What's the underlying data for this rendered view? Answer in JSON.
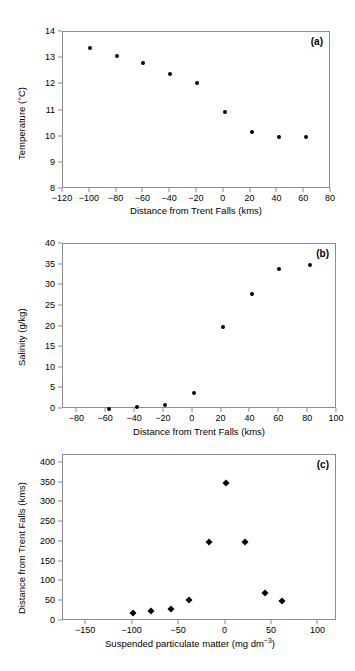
{
  "figure": {
    "background_color": "#ffffff",
    "marker_color": "#000000",
    "axis_color": "#8c8c8c"
  },
  "chart_data": [
    {
      "type": "scatter",
      "panel_label": "(a)",
      "title": "",
      "xlabel": "Distance from Trent Falls (kms)",
      "ylabel": "Temperature (°C)",
      "xlim": [
        -120,
        80
      ],
      "ylim": [
        8,
        14
      ],
      "xticks": [
        -120,
        -100,
        -80,
        -60,
        -40,
        -20,
        0,
        20,
        40,
        60,
        80
      ],
      "xticklabels": [
        "−120",
        "−100",
        "−80",
        "−60",
        "−40",
        "−20",
        "0",
        "20",
        "40",
        "60",
        "80"
      ],
      "yticks": [
        8,
        9,
        10,
        11,
        12,
        13,
        14
      ],
      "yticklabels": [
        "8",
        "9",
        "10",
        "11",
        "12",
        "13",
        "14"
      ],
      "grid": false,
      "legend": "none",
      "marker": "circle",
      "x": [
        -100,
        -80,
        -60,
        -40,
        -20,
        1,
        21,
        41,
        61
      ],
      "y": [
        13.4,
        13.1,
        12.8,
        12.4,
        12.05,
        10.95,
        10.18,
        10.0,
        10.0
      ]
    },
    {
      "type": "scatter",
      "panel_label": "(b)",
      "title": "",
      "xlabel": "Distance from Trent Falls (kms)",
      "ylabel": "Salinity (g/kg)",
      "xlim": [
        -90,
        100
      ],
      "ylim": [
        0,
        40
      ],
      "xticks": [
        -80,
        -60,
        -40,
        -20,
        0,
        20,
        40,
        60,
        80,
        100
      ],
      "xticklabels": [
        "−80",
        "−60",
        "−40",
        "−20",
        "0",
        "20",
        "40",
        "60",
        "80",
        "100"
      ],
      "yticks": [
        0,
        5,
        10,
        15,
        20,
        25,
        30,
        35,
        40
      ],
      "yticklabels": [
        "0",
        "5",
        "10",
        "15",
        "20",
        "25",
        "30",
        "35",
        "40"
      ],
      "grid": false,
      "legend": "none",
      "marker": "circle",
      "x": [
        -58,
        -39,
        -19,
        1,
        21,
        41,
        60,
        81
      ],
      "y": [
        0.1,
        0.5,
        1.0,
        3.9,
        19.9,
        27.8,
        34.0,
        35.0
      ]
    },
    {
      "type": "scatter",
      "panel_label": "(c)",
      "title": "",
      "xlabel": "Suspended particulate matter (mg dm−3)",
      "xlabel_base": "Suspended particulate matter (mg dm",
      "xlabel_sup": "−3",
      "xlabel_tail": ")",
      "ylabel": "Distance from Trent Falls (kms)",
      "xlim": [
        -175,
        120
      ],
      "ylim": [
        0,
        420
      ],
      "xticks": [
        -150,
        -100,
        -50,
        0,
        50,
        100
      ],
      "xticklabels": [
        "−150",
        "−100",
        "−50",
        "0",
        "50",
        "100"
      ],
      "yticks": [
        0,
        50,
        100,
        150,
        200,
        250,
        300,
        350,
        400
      ],
      "yticklabels": [
        "0",
        "50",
        "100",
        "150",
        "200",
        "250",
        "300",
        "350",
        "400"
      ],
      "grid": false,
      "legend": "none",
      "marker": "diamond",
      "x": [
        -100,
        -80,
        -59,
        -39,
        -18,
        1,
        21,
        42,
        61
      ],
      "y": [
        21,
        25,
        30,
        54,
        199,
        348,
        199,
        70,
        50
      ]
    }
  ]
}
